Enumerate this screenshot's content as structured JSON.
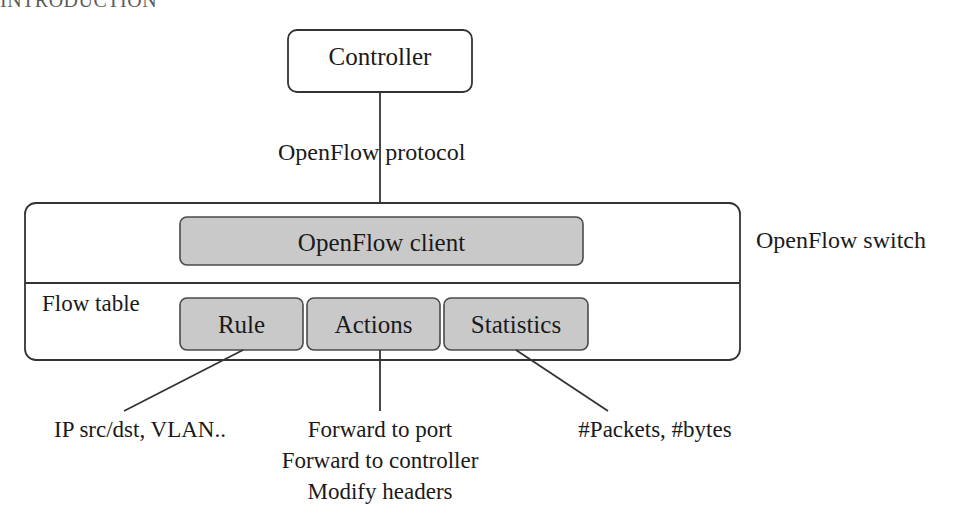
{
  "page": {
    "running_head": "INTRODUCTION",
    "background_color": "#ffffff",
    "box_fill_gray": "#c9c9c9",
    "stroke_color": "#333333"
  },
  "controller": {
    "label": "Controller"
  },
  "link": {
    "protocol_label": "OpenFlow protocol"
  },
  "switch": {
    "outside_label": "OpenFlow switch",
    "client_label": "OpenFlow client",
    "flow_table_label": "Flow table",
    "columns": [
      {
        "label": "Rule"
      },
      {
        "label": "Actions"
      },
      {
        "label": "Statistics"
      }
    ]
  },
  "annotations": [
    {
      "for": "Rule",
      "lines": [
        "IP src/dst, VLAN.."
      ]
    },
    {
      "for": "Actions",
      "lines": [
        "Forward to port",
        "Forward to controller",
        "Modify headers"
      ]
    },
    {
      "for": "Statistics",
      "lines": [
        "#Packets, #bytes"
      ]
    }
  ]
}
